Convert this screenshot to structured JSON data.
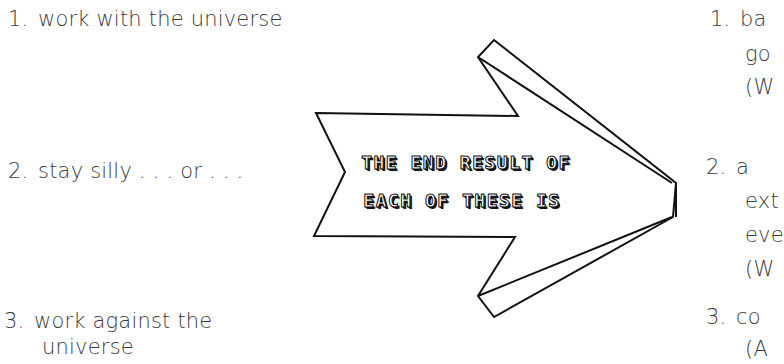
{
  "left_list": [
    {
      "num": "1.",
      "lines": [
        "work with the universe"
      ]
    },
    {
      "num": "2.",
      "lines": [
        "stay silly . . . or . . ."
      ]
    },
    {
      "num": "3.",
      "lines": [
        "work against the",
        "universe"
      ]
    }
  ],
  "arrow": {
    "line1": "THE END RESULT OF",
    "line2": "EACH OF THESE IS",
    "stroke_color": "#111111",
    "fill_color": "#ffffff"
  },
  "right_list": [
    {
      "num": "1.",
      "lines": [
        "ba",
        "go",
        "(W"
      ]
    },
    {
      "num": "2.",
      "lines": [
        "a",
        "ext",
        "eve",
        "(W"
      ]
    },
    {
      "num": "3.",
      "lines": [
        "co",
        "(A"
      ]
    }
  ]
}
